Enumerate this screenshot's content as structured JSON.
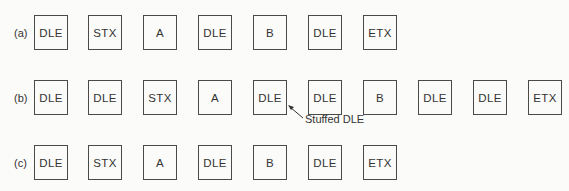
{
  "rows": [
    {
      "label": "(a)",
      "cells": [
        "DLE",
        "STX",
        "A",
        "DLE",
        "B",
        "DLE",
        "ETX"
      ]
    },
    {
      "label": "(b)",
      "cells": [
        "DLE",
        "DLE",
        "STX",
        "A",
        "DLE",
        "DLE",
        "B",
        "DLE",
        "DLE",
        "ETX"
      ]
    },
    {
      "label": "(c)",
      "cells": [
        "DLE",
        "STX",
        "A",
        "DLE",
        "B",
        "DLE",
        "ETX"
      ]
    }
  ],
  "annotation": {
    "text": "Stuffed DLE",
    "points_to": "row b, cell 5"
  }
}
